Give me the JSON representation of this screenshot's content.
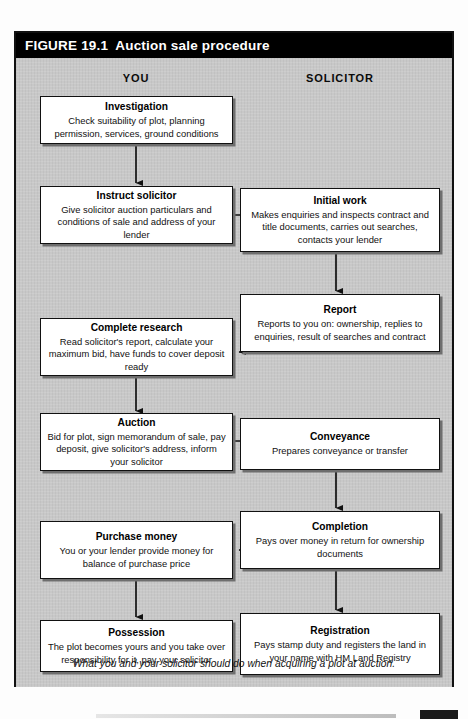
{
  "figure": {
    "number": "FIGURE 19.1",
    "title": "Auction sale procedure",
    "caption": "What you and your solicitor should do when acquiring a plot at auction.",
    "columns": [
      {
        "id": "you",
        "label": "YOU"
      },
      {
        "id": "solicitor",
        "label": "SOLICITOR"
      }
    ],
    "colors": {
      "titlebar_background": "#000000",
      "titlebar_text": "#ffffff",
      "canvas_background": "#c8c8c8",
      "box_background": "#ffffff",
      "box_border": "#111111",
      "box_shadow": "#6e6e6e",
      "arrow": "#111111"
    },
    "nodes": [
      {
        "id": "investigation",
        "column": "you",
        "heading": "Investigation",
        "body": "Check suitability of plot, planning permission, services, ground conditions"
      },
      {
        "id": "instruct-solicitor",
        "column": "you",
        "heading": "Instruct solicitor",
        "body": "Give solicitor auction particulars and conditions of sale and address of your lender"
      },
      {
        "id": "initial-work",
        "column": "solicitor",
        "heading": "Initial work",
        "body": "Makes enquiries and inspects contract and title documents, carries out searches, contacts your lender"
      },
      {
        "id": "report",
        "column": "solicitor",
        "heading": "Report",
        "body": "Reports to you on: ownership, replies to enquiries, result of searches and contract"
      },
      {
        "id": "complete-research",
        "column": "you",
        "heading": "Complete research",
        "body": "Read solicitor's report, calculate your maximum bid, have funds to cover deposit ready"
      },
      {
        "id": "auction",
        "column": "you",
        "heading": "Auction",
        "body": "Bid for plot, sign memorandum of sale, pay deposit, give solicitor's address, inform your solicitor"
      },
      {
        "id": "conveyance",
        "column": "solicitor",
        "heading": "Conveyance",
        "body": "Prepares conveyance or transfer"
      },
      {
        "id": "completion",
        "column": "solicitor",
        "heading": "Completion",
        "body": "Pays over money in return for ownership documents"
      },
      {
        "id": "purchase-money",
        "column": "you",
        "heading": "Purchase money",
        "body": "You or your lender provide money for balance of purchase price"
      },
      {
        "id": "possession",
        "column": "you",
        "heading": "Possession",
        "body": "The plot becomes yours and you take over responsibility for it, pay your solicitor"
      },
      {
        "id": "registration",
        "column": "solicitor",
        "heading": "Registration",
        "body": "Pays stamp duty and registers the land in your name with HM Land Registry"
      }
    ],
    "edges": [
      {
        "from": "investigation",
        "to": "instruct-solicitor",
        "direction": "down"
      },
      {
        "from": "instruct-solicitor",
        "to": "initial-work",
        "direction": "right"
      },
      {
        "from": "initial-work",
        "to": "report",
        "direction": "down"
      },
      {
        "from": "report",
        "to": "complete-research",
        "direction": "left"
      },
      {
        "from": "complete-research",
        "to": "auction",
        "direction": "down"
      },
      {
        "from": "auction",
        "to": "conveyance",
        "direction": "right"
      },
      {
        "from": "conveyance",
        "to": "completion",
        "direction": "down"
      },
      {
        "from": "completion",
        "to": "purchase-money",
        "direction": "left"
      },
      {
        "from": "purchase-money",
        "to": "possession",
        "direction": "down"
      },
      {
        "from": "completion",
        "to": "registration",
        "direction": "down"
      }
    ]
  }
}
